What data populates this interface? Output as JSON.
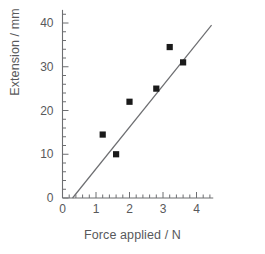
{
  "chart_data": {
    "type": "scatter",
    "title": "",
    "xlabel": "Force applied / N",
    "ylabel": "Extension / mm",
    "xlim": [
      0,
      4.5
    ],
    "ylim": [
      0,
      43
    ],
    "grid": false,
    "legend": null,
    "x_ticks": [
      0,
      1,
      2,
      3,
      4
    ],
    "x_tick_labels": [
      "0",
      "1",
      "2",
      "3",
      "4"
    ],
    "x_minor_tick_step": 0.2,
    "y_ticks": [
      0,
      10,
      20,
      30,
      40
    ],
    "y_tick_labels": [
      "0",
      "10",
      "20",
      "30",
      "40"
    ],
    "y_minor_tick_step": 2,
    "marker_style": "filled-square",
    "marker_color": "#1a1a1a",
    "line_color": "#6d6e71",
    "axis_color": "#6d6e71",
    "points": [
      {
        "x": 1.2,
        "y": 14.5
      },
      {
        "x": 1.6,
        "y": 10.0
      },
      {
        "x": 2.0,
        "y": 22.0
      },
      {
        "x": 2.8,
        "y": 25.0
      },
      {
        "x": 3.2,
        "y": 34.5
      },
      {
        "x": 3.6,
        "y": 31.0
      }
    ],
    "trend_line": {
      "label": "line of best fit",
      "x_start": 0.3,
      "y_start": 0.0,
      "x_end": 4.45,
      "y_end": 39.5
    }
  }
}
